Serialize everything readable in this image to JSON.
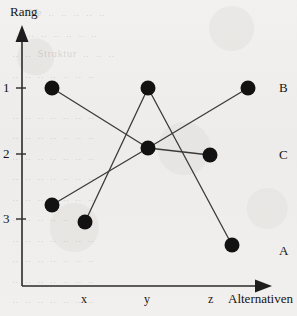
{
  "figure": {
    "y_axis_title": "Rang",
    "x_axis_title": "Alternativen"
  },
  "axes": {
    "y_ticks": [
      {
        "label": "1"
      },
      {
        "label": "2"
      },
      {
        "label": "3"
      }
    ],
    "x_ticks": [
      {
        "label": "x"
      },
      {
        "label": "y"
      },
      {
        "label": "z"
      }
    ]
  },
  "series_labels": [
    {
      "label": "B"
    },
    {
      "label": "C"
    },
    {
      "label": "A"
    }
  ],
  "ghost": {
    "lines": "  ..  Die  ..  ..  ..  ..  ..\n   ..  ..  ..  ..  ..  ..  ..\n  ..  ..  Struktur  ..  ..  ..\n  ..  ..  ..  ..  ..  ..  ..\n\n  ..  ..  ..  ..  ..  ..  ..\n  ..  ..  ..  ..  ..  ..  ..\n  ..  ..  ..  ..  ..  ..  ..\n  ..  ..  ..  ..  ..  ..  ..\n  ..  ..  ..  ..  ..  ..  ..\n  ..  ..  ..  ..  ..  ..  ..\n  ..  ..  ..  ..  ..  ..  ..\n  ..  ..  ..  ..  ..  ..  ..\n  ..  ..  ..  ..  ..  ..  ..\n  ..  ..  ..  ..  ..  ..  ..\n  ..  ..  ..  ..  ..  ..  .."
  },
  "chart_data": {
    "type": "line",
    "title": "",
    "subtitle": "",
    "xlabel": "Alternativen",
    "ylabel": "Rang",
    "grid": false,
    "legend_position": "right-of-axes",
    "categories": [
      "x",
      "y",
      "z"
    ],
    "ytick_labels": [
      "1",
      "2",
      "3"
    ],
    "ylim": [
      0.6,
      3.6
    ],
    "y_inverted": true,
    "series": [
      {
        "name": "B",
        "values": [
          1.0,
          2.0,
          1.0
        ],
        "points": [
          {
            "x": "x",
            "rank": 1.0
          },
          {
            "x": "y",
            "rank": 2.0
          },
          {
            "x": "z",
            "rank": 1.0
          }
        ]
      },
      {
        "name": "C",
        "values": [
          2.8,
          2.0,
          2.1
        ],
        "points": [
          {
            "x": "x",
            "rank": 2.8
          },
          {
            "x": "y",
            "rank": 2.0
          },
          {
            "x": "z",
            "rank": 2.1
          }
        ]
      },
      {
        "name": "A",
        "values": [
          3.0,
          1.0,
          3.5
        ],
        "points": [
          {
            "x": "x",
            "rank": 3.0
          },
          {
            "x": "y",
            "rank": 1.0
          },
          {
            "x": "z",
            "rank": 3.5
          }
        ]
      }
    ],
    "marker": "filled-circle",
    "marker_color": "#121212",
    "line_color": "#3a3a3a"
  },
  "geometry": {
    "y_axis_x": 22,
    "x_axis_y": 286,
    "tick_y": {
      "1": 88,
      "2": 154,
      "3": 219
    },
    "cat_x": {
      "x": 85,
      "y": 148,
      "z": 211
    },
    "marker_radius": 7.5,
    "series_label_x": 283,
    "series_label_y": {
      "B": 88,
      "C": 155,
      "A": 251
    },
    "points": {
      "B": [
        [
          52,
          88
        ],
        [
          148,
          148
        ],
        [
          248,
          88
        ]
      ],
      "C": [
        [
          52,
          205
        ],
        [
          148,
          148
        ],
        [
          210,
          155
        ]
      ],
      "A": [
        [
          85,
          222
        ],
        [
          148,
          88
        ],
        [
          232,
          245
        ]
      ]
    }
  }
}
